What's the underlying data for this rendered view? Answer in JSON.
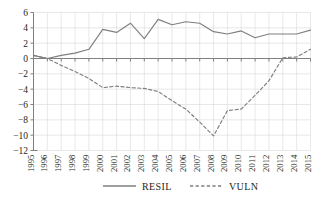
{
  "chart_data": {
    "type": "line",
    "title": "",
    "subtitle": "",
    "xlabel": "",
    "ylabel": "",
    "x": [
      1995,
      1996,
      1997,
      1998,
      1999,
      2000,
      2001,
      2002,
      2003,
      2004,
      2005,
      2006,
      2007,
      2008,
      2009,
      2010,
      2011,
      2012,
      2013,
      2014,
      2015
    ],
    "categories": [
      "1995",
      "1996",
      "1997",
      "1998",
      "1999",
      "2000",
      "2001",
      "2002",
      "2003",
      "2004",
      "2005",
      "2006",
      "2007",
      "2008",
      "2009",
      "2010",
      "2011",
      "2012",
      "2013",
      "2014",
      "2015"
    ],
    "series": [
      {
        "name": "RESIL",
        "style": "solid",
        "color": "#7f7f7f",
        "values": [
          0.4,
          0.0,
          0.4,
          0.7,
          1.2,
          3.8,
          3.4,
          4.6,
          2.6,
          5.1,
          4.4,
          4.8,
          4.6,
          3.5,
          3.2,
          3.6,
          2.7,
          3.2,
          3.2,
          3.2,
          3.7
        ]
      },
      {
        "name": "VULN",
        "style": "dashed",
        "color": "#7f7f7f",
        "values": [
          0.4,
          0.0,
          -0.9,
          -1.7,
          -2.6,
          -3.8,
          -3.6,
          -3.8,
          -3.9,
          -4.3,
          -5.5,
          -6.6,
          -8.3,
          -10.1,
          -6.8,
          -6.6,
          -4.8,
          -2.9,
          0.1,
          0.2,
          1.2
        ]
      }
    ],
    "ylim": [
      -12,
      6
    ],
    "xlim": [
      1995,
      2015
    ],
    "yticks": [
      6,
      4,
      2,
      0,
      -2,
      -4,
      -6,
      -8,
      -10,
      -12
    ],
    "ytick_labels": [
      "6",
      "4",
      "2",
      "0",
      "−2",
      "−4",
      "−6",
      "−8",
      "−10",
      "−12"
    ],
    "grid": true,
    "grid_color": "#d9d9d9",
    "axis_color": "#808080",
    "legend_position": "bottom",
    "legend": [
      "RESIL",
      "VULN"
    ]
  },
  "legend": {
    "items": [
      {
        "label": "RESIL",
        "style": "solid"
      },
      {
        "label": "VULN",
        "style": "dashed"
      }
    ]
  }
}
